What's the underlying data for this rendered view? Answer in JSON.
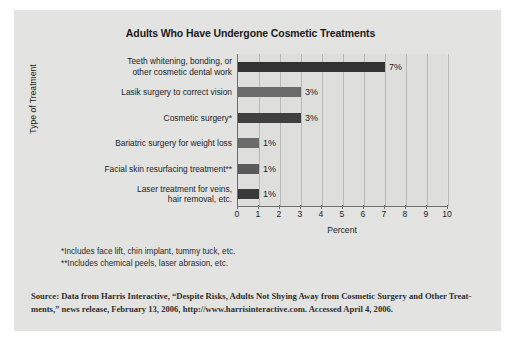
{
  "chart_data": {
    "type": "bar",
    "orientation": "horizontal",
    "title": "Adults Who Have Undergone Cosmetic Treatments",
    "xlabel": "Percent",
    "ylabel": "Type of Treatment",
    "xlim": [
      0,
      10
    ],
    "xticks": [
      0,
      1,
      2,
      3,
      4,
      5,
      6,
      7,
      8,
      9,
      10
    ],
    "grid": true,
    "legend": "none",
    "categories": [
      "Teeth whitening, bonding, or other cosmetic dental work",
      "Lasik surgery to correct vision",
      "Cosmetic surgery*",
      "Bariatric surgery for weight loss",
      "Facial skin resurfacing treatment**",
      "Laser treatment for veins, hair removal, etc."
    ],
    "category_lines": [
      [
        "Teeth whitening, bonding, or",
        "other cosmetic dental work"
      ],
      [
        "Lasik surgery to correct vision"
      ],
      [
        "Cosmetic surgery*"
      ],
      [
        "Bariatric surgery for weight loss"
      ],
      [
        "Facial skin resurfacing treatment**"
      ],
      [
        "Laser treatment for veins,",
        "hair removal, etc."
      ]
    ],
    "values": [
      7,
      3,
      3,
      1,
      1,
      1
    ],
    "value_labels": [
      "7%",
      "3%",
      "3%",
      "1%",
      "1%",
      "1%"
    ],
    "bar_colors": [
      "#333333",
      "#6b6b6b",
      "#3f3f3f",
      "#6b6b6b",
      "#5a5a5a",
      "#3a3a3a"
    ]
  },
  "footnotes": [
    "*Includes face lift, chin implant, tummy tuck, etc.",
    "**Includes chemical peels, laser abrasion, etc."
  ],
  "source": {
    "line1": "Source: Data from Harris Interactive, “Despite Risks, Adults Not Shying Away from Cosmetic Surgery and Other Treat-",
    "line2": "ments,” news release, February 13, 2006, http://www.harrisinteractive.com. Accessed April 4, 2006."
  },
  "colors": {
    "card_background": "#e3e3e1",
    "plot_background": "#dededc",
    "axis": "#6e6e6e",
    "gridline": "#b9b9b7",
    "text": "#1d1d1d"
  }
}
